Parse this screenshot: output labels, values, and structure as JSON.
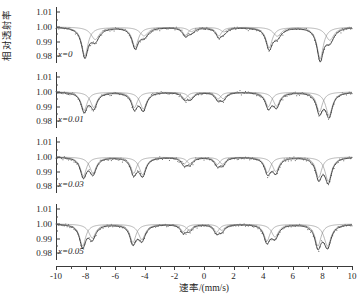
{
  "axes": {
    "ylabel": "相对透射率",
    "xlabel": "速率/(mm/s)",
    "yticks": [
      "1.01",
      "1.00",
      "0.99",
      "0.98"
    ],
    "xticks": [
      "-10",
      "-8",
      "-6",
      "-4",
      "-2",
      "0",
      "2",
      "4",
      "6",
      "8",
      "10"
    ]
  },
  "panels": [
    {
      "label": "x=0"
    },
    {
      "label": "x=0.01"
    },
    {
      "label": "x=0.03"
    },
    {
      "label": "x=0.05"
    }
  ],
  "chart_data": {
    "type": "line",
    "title": "",
    "xlabel": "速率/(mm/s)",
    "ylabel": "相对透射率",
    "xlim": [
      -10,
      10
    ],
    "ylim": [
      0.975,
      1.014
    ],
    "ytick_values": [
      1.01,
      1.0,
      0.99,
      0.98
    ],
    "xtick_values": [
      -10,
      -8,
      -6,
      -4,
      -2,
      0,
      2,
      4,
      6,
      8,
      10
    ],
    "grid": false,
    "legend": "none",
    "panels": [
      {
        "label": "x=0",
        "baseline": 1.0,
        "subspectra": [
          {
            "name": "sextet-A",
            "positions": [
              -8.05,
              -4.65,
              -1.25,
              1.0,
              4.4,
              7.85
            ],
            "depths": [
              0.0195,
              0.0135,
              0.0055,
              0.006,
              0.014,
              0.0215
            ],
            "widths": [
              0.52,
              0.52,
              0.48,
              0.48,
              0.52,
              0.52
            ]
          },
          {
            "name": "sextet-B",
            "positions": [
              -7.35,
              -4.05,
              -0.85,
              1.35,
              4.95,
              8.5
            ],
            "depths": [
              0.0085,
              0.006,
              0.003,
              0.0032,
              0.0062,
              0.009
            ],
            "widths": [
              0.7,
              0.68,
              0.6,
              0.6,
              0.68,
              0.7
            ]
          }
        ]
      },
      {
        "label": "x=0.01",
        "baseline": 1.0,
        "subspectra": [
          {
            "name": "sextet-A",
            "positions": [
              -8.1,
              -4.7,
              -1.3,
              0.95,
              4.35,
              7.8
            ],
            "depths": [
              0.0125,
              0.0105,
              0.0045,
              0.0048,
              0.01,
              0.0135
            ],
            "widths": [
              0.5,
              0.5,
              0.46,
              0.46,
              0.5,
              0.5
            ]
          },
          {
            "name": "sextet-B",
            "positions": [
              -7.45,
              -4.1,
              -0.9,
              1.3,
              4.9,
              8.45
            ],
            "depths": [
              0.0105,
              0.0115,
              0.0042,
              0.0045,
              0.0095,
              0.016
            ],
            "widths": [
              0.55,
              0.55,
              0.5,
              0.5,
              0.55,
              0.55
            ]
          }
        ]
      },
      {
        "label": "x=0.03",
        "baseline": 1.0,
        "subspectra": [
          {
            "name": "sextet-A",
            "positions": [
              -8.15,
              -4.75,
              -1.35,
              0.9,
              4.3,
              7.75
            ],
            "depths": [
              0.013,
              0.011,
              0.0048,
              0.005,
              0.0105,
              0.014
            ],
            "widths": [
              0.5,
              0.5,
              0.46,
              0.46,
              0.5,
              0.5
            ]
          },
          {
            "name": "sextet-B",
            "positions": [
              -7.5,
              -4.15,
              -0.95,
              1.25,
              4.85,
              8.4
            ],
            "depths": [
              0.011,
              0.012,
              0.0045,
              0.0048,
              0.0098,
              0.0165
            ],
            "widths": [
              0.55,
              0.55,
              0.5,
              0.5,
              0.55,
              0.55
            ]
          }
        ]
      },
      {
        "label": "x=0.05",
        "baseline": 1.0,
        "subspectra": [
          {
            "name": "sextet-A",
            "positions": [
              -8.2,
              -4.8,
              -1.4,
              0.85,
              4.25,
              7.7
            ],
            "depths": [
              0.015,
              0.0125,
              0.0052,
              0.0055,
              0.0115,
              0.015
            ],
            "widths": [
              0.5,
              0.5,
              0.46,
              0.46,
              0.5,
              0.5
            ]
          },
          {
            "name": "sextet-B",
            "positions": [
              -7.55,
              -4.2,
              -1.0,
              1.2,
              4.8,
              8.35
            ],
            "depths": [
              0.0095,
              0.0105,
              0.004,
              0.0042,
              0.0088,
              0.015
            ],
            "widths": [
              0.58,
              0.58,
              0.52,
              0.52,
              0.58,
              0.58
            ]
          }
        ]
      }
    ]
  }
}
